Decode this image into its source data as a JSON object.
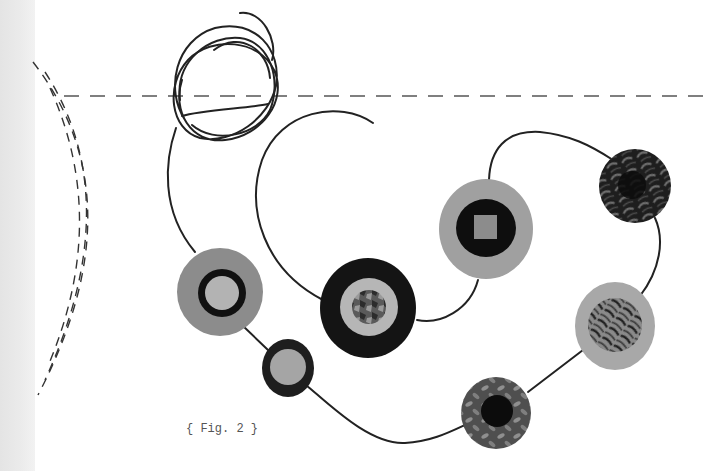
{
  "figure": {
    "caption": "{ Fig. 2 }"
  },
  "colors": {
    "background": "#ffffff",
    "left_strip": "#e6e6e6",
    "thread": "#222222",
    "dashed_line": "#555555",
    "light_gray": "#b5b5b5",
    "mid_gray": "#8e8e8e",
    "dark": "#141414"
  },
  "elements": {
    "thread_scribble": "scribble-loop",
    "dashed_guideline": "horizontal-dashed-line",
    "stitched_arcs": "three-dashed-arcs",
    "circles": [
      {
        "id": "circle-1",
        "style": "gray-ring-black-ring-light-center"
      },
      {
        "id": "circle-2",
        "style": "dark-ring-light-center"
      },
      {
        "id": "circle-3",
        "style": "black-ring-light-ring-patterned-center"
      },
      {
        "id": "circle-4",
        "style": "gray-ring-black-ring-square-center"
      },
      {
        "id": "circle-5",
        "style": "dark-leaf-pattern"
      },
      {
        "id": "circle-6",
        "style": "gray-ring-leaf-pattern-center"
      },
      {
        "id": "circle-7",
        "style": "leaf-pattern-dark-center"
      }
    ]
  }
}
